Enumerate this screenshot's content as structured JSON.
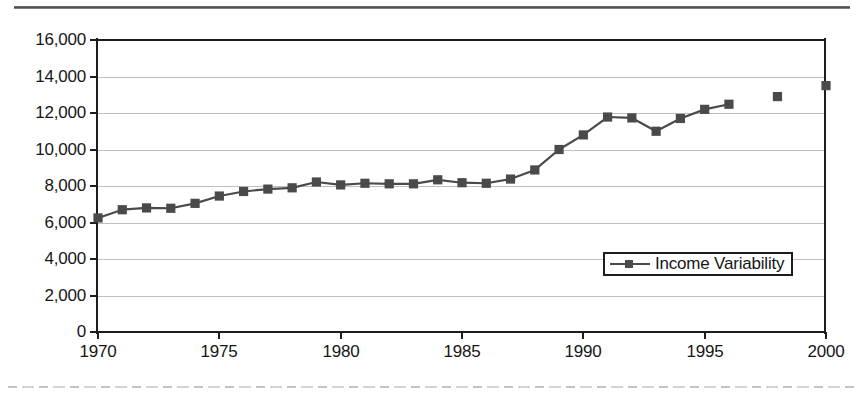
{
  "chart_data": {
    "type": "line",
    "title": "",
    "xlabel": "",
    "ylabel": "",
    "xlim": [
      1970,
      2000
    ],
    "ylim": [
      0,
      16000
    ],
    "grid": true,
    "legend_position": "bottom-right",
    "y_ticks": [
      "16,000",
      "14,000",
      "12,000",
      "10,000",
      "8,000",
      "6,000",
      "4,000",
      "2,000",
      "0"
    ],
    "y_tick_values": [
      16000,
      14000,
      12000,
      10000,
      8000,
      6000,
      4000,
      2000,
      0
    ],
    "x_ticks": [
      "1970",
      "1975",
      "1980",
      "1985",
      "1990",
      "1995",
      "2000"
    ],
    "x_tick_values": [
      1970,
      1975,
      1980,
      1985,
      1990,
      1995,
      2000
    ],
    "series": [
      {
        "name": "Income Variability",
        "color": "#4a4a4a",
        "marker": "square",
        "x": [
          1970,
          1971,
          1972,
          1973,
          1974,
          1975,
          1976,
          1977,
          1978,
          1979,
          1980,
          1981,
          1982,
          1983,
          1984,
          1985,
          1986,
          1987,
          1988,
          1989,
          1990,
          1991,
          1992,
          1993,
          1994,
          1995,
          1996,
          1998,
          2000
        ],
        "values": [
          6250,
          6700,
          6800,
          6780,
          7050,
          7450,
          7700,
          7830,
          7900,
          8220,
          8060,
          8150,
          8120,
          8120,
          8340,
          8180,
          8150,
          8380,
          8880,
          10000,
          10800,
          11780,
          11730,
          11000,
          11700,
          12200,
          12480,
          12900,
          13500
        ],
        "connected_through": 1996,
        "isolated_points": [
          1998,
          2000
        ]
      }
    ]
  },
  "legend": {
    "entries": [
      {
        "label": "Income Variability"
      }
    ]
  }
}
